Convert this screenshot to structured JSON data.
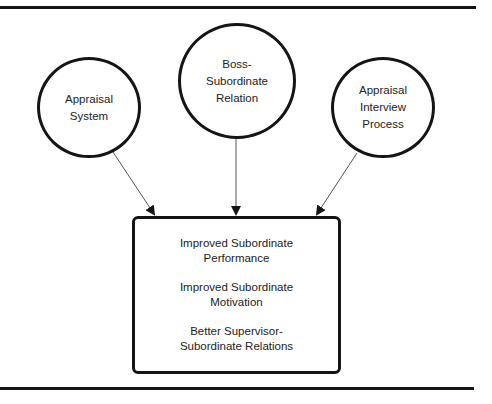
{
  "diagram": {
    "inputs": [
      {
        "id": "appraisal-system",
        "lines": [
          "Appraisal",
          "System"
        ]
      },
      {
        "id": "boss-subordinate-relation",
        "lines": [
          "Boss-",
          "Subordinate",
          "Relation"
        ]
      },
      {
        "id": "appraisal-interview-process",
        "lines": [
          "Appraisal",
          "Interview",
          "Process"
        ]
      }
    ],
    "outcomes": [
      {
        "lines": [
          "Improved Subordinate",
          "Performance"
        ]
      },
      {
        "lines": [
          "Improved Subordinate",
          "Motivation"
        ]
      },
      {
        "lines": [
          "Better Supervisor-",
          "Subordinate Relations"
        ]
      }
    ],
    "edges": [
      {
        "from": "appraisal-system",
        "to": "outcomes"
      },
      {
        "from": "boss-subordinate-relation",
        "to": "outcomes"
      },
      {
        "from": "appraisal-interview-process",
        "to": "outcomes"
      }
    ],
    "colors": {
      "stroke": "#151515",
      "arrow_line": "#555555",
      "text": "#222222",
      "background": "#ffffff"
    }
  }
}
